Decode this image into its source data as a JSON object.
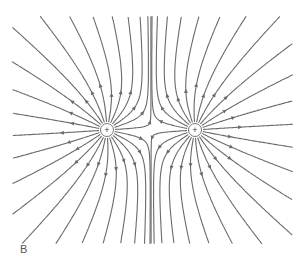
{
  "diagram": {
    "panel_label": "B",
    "line_color": "#6a6a6a",
    "charges": [
      {
        "id": "left",
        "sign": "+",
        "symbol": "(+)",
        "x": 107,
        "y": 130
      },
      {
        "id": "right",
        "sign": "+",
        "symbol": "(+)",
        "x": 195,
        "y": 130
      }
    ],
    "lines_per_charge": 24,
    "clip": {
      "left": 12,
      "right": 293,
      "top": 16,
      "bottom": 244
    },
    "arrow_direction": "outward"
  }
}
